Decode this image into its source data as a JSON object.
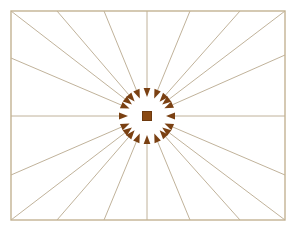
{
  "diagram": {
    "canvas": {
      "width": 296,
      "height": 229,
      "background": "#ffffff"
    },
    "colors": {
      "ray_line": "#b9a98e",
      "frame_border": "#c3b393",
      "arrowhead": "#7a4012",
      "center_square_fill": "#8a4a14",
      "center_square_stroke": "#6d3a0f",
      "background": "#ffffff"
    },
    "frame": {
      "label": "Bounding rectangle",
      "x": 11,
      "y": 11,
      "width": 274,
      "height": 209,
      "stroke_width": 1.4
    },
    "center": {
      "label": "Convergence point",
      "x": 147,
      "y": 116,
      "square_size": 9,
      "arrow_stop_radius": 19
    },
    "arrow": {
      "head_length": 9,
      "head_half_width": 3.4,
      "line_width": 0.9,
      "count": 20,
      "direction": "inward"
    },
    "rays": [
      {
        "name": "ray-right",
        "outer_x": 285,
        "outer_y": 116
      },
      {
        "name": "ray-right-upper-shallow",
        "outer_x": 285,
        "outer_y": 55
      },
      {
        "name": "ray-upper-right-corner",
        "outer_x": 285,
        "outer_y": 11
      },
      {
        "name": "ray-top-right-far",
        "outer_x": 240,
        "outer_y": 11
      },
      {
        "name": "ray-top-right-near",
        "outer_x": 190,
        "outer_y": 11
      },
      {
        "name": "ray-top-vertical",
        "outer_x": 147,
        "outer_y": 11
      },
      {
        "name": "ray-top-left-near",
        "outer_x": 104,
        "outer_y": 11
      },
      {
        "name": "ray-top-left-far",
        "outer_x": 57,
        "outer_y": 11
      },
      {
        "name": "ray-upper-left-corner",
        "outer_x": 11,
        "outer_y": 11
      },
      {
        "name": "ray-left-upper-shallow",
        "outer_x": 11,
        "outer_y": 58
      },
      {
        "name": "ray-left",
        "outer_x": 11,
        "outer_y": 116
      },
      {
        "name": "ray-left-lower-shallow",
        "outer_x": 11,
        "outer_y": 175
      },
      {
        "name": "ray-lower-left-corner",
        "outer_x": 11,
        "outer_y": 220
      },
      {
        "name": "ray-bottom-left-far",
        "outer_x": 57,
        "outer_y": 220
      },
      {
        "name": "ray-bottom-left-near",
        "outer_x": 104,
        "outer_y": 220
      },
      {
        "name": "ray-bottom-vertical",
        "outer_x": 147,
        "outer_y": 220
      },
      {
        "name": "ray-bottom-right-near",
        "outer_x": 190,
        "outer_y": 220
      },
      {
        "name": "ray-bottom-right-far",
        "outer_x": 240,
        "outer_y": 220
      },
      {
        "name": "ray-lower-right-corner",
        "outer_x": 285,
        "outer_y": 220
      },
      {
        "name": "ray-right-lower-shallow",
        "outer_x": 285,
        "outer_y": 175
      }
    ]
  }
}
